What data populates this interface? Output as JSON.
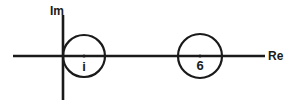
{
  "figure": {
    "background_color": "#ffffff",
    "stroke_color": "#1a1a1a"
  },
  "axes": {
    "imaginary": {
      "label": "Im",
      "x": 63,
      "y_start": 15,
      "y_end": 100,
      "stroke_width": 2.6
    },
    "real": {
      "label": "Re",
      "y": 56,
      "x_start": 13,
      "x_end": 265,
      "stroke_width": 2.6
    }
  },
  "circles": [
    {
      "name": "circle-i",
      "center_label": "i",
      "cx": 84,
      "cy": 56,
      "r": 21,
      "stroke_width": 2.2,
      "center_dot_radius": 1.6
    },
    {
      "name": "circle-6",
      "center_label": "6",
      "cx": 200,
      "cy": 56,
      "r": 22,
      "stroke_width": 2.2,
      "center_dot_radius": 1.6
    }
  ]
}
